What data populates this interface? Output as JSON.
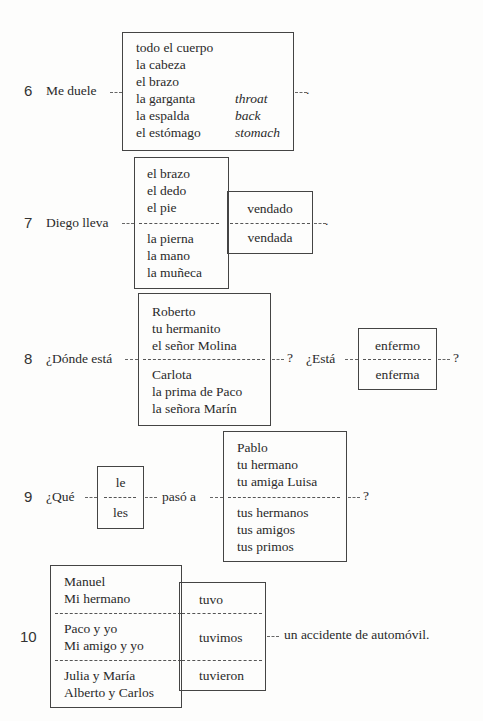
{
  "items": [
    {
      "number": "6",
      "prompt": "Me duele",
      "options": [
        {
          "es": "todo el cuerpo",
          "en": ""
        },
        {
          "es": "la cabeza",
          "en": ""
        },
        {
          "es": "el brazo",
          "en": ""
        },
        {
          "es": "la garganta",
          "en": "throat"
        },
        {
          "es": "la espalda",
          "en": "back"
        },
        {
          "es": "el estómago",
          "en": "stomach"
        }
      ],
      "end": "."
    },
    {
      "number": "7",
      "prompt": "Diego lleva",
      "group_masc": [
        "el brazo",
        "el dedo",
        "el pie"
      ],
      "group_fem": [
        "la pierna",
        "la mano",
        "la muñeca"
      ],
      "adj": [
        "vendado",
        "vendada"
      ],
      "end": "."
    },
    {
      "number": "8",
      "prompt": "¿Dónde está",
      "group_masc": [
        "Roberto",
        "tu hermanito",
        "el señor Molina"
      ],
      "group_fem": [
        "Carlota",
        "la prima de Paco",
        "la señora Marín"
      ],
      "q1": "?",
      "prompt2": "¿Está",
      "adj": [
        "enfermo",
        "enferma"
      ],
      "q2": "?"
    },
    {
      "number": "9",
      "prompt": "¿Qué",
      "pronouns": [
        "le",
        "les"
      ],
      "middle": "pasó a",
      "group_sing": [
        "Pablo",
        "tu hermano",
        "tu amiga Luisa"
      ],
      "group_plur": [
        "tus hermanos",
        "tus amigos",
        "tus primos"
      ],
      "end": "?"
    },
    {
      "number": "10",
      "subjects": [
        [
          "Manuel",
          "Mi hermano"
        ],
        [
          "Paco y yo",
          "Mi amigo y yo"
        ],
        [
          "Julia y María",
          "Alberto y Carlos"
        ]
      ],
      "verbs": [
        "tuvo",
        "tuvimos",
        "tuvieron"
      ],
      "end": "un accidente de automóvil."
    }
  ]
}
